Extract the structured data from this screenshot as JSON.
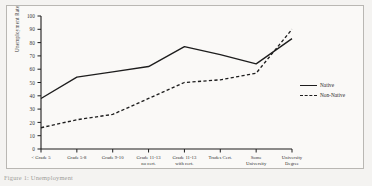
{
  "figure": {
    "caption": "Figure 1: Unemployment"
  },
  "legend": {
    "position": "right",
    "items": [
      {
        "label": "Native",
        "style": "solid"
      },
      {
        "label": "Non-Native",
        "style": "dashed"
      }
    ]
  },
  "axes": {
    "ylabel": "Unemployment Rate",
    "yticks": [
      "100",
      "90",
      "80",
      "70",
      "60",
      "50",
      "40",
      "30",
      "20",
      "10",
      "0"
    ],
    "xticks": [
      "< Grade 5",
      "Grade 5-8",
      "Grade 9-10",
      "Grade 11-13 no cert.",
      "Grade 11-13 with cert.",
      "Trades Cert.",
      "Some University",
      "University Degree"
    ]
  },
  "chart_data": {
    "type": "line",
    "title": "",
    "xlabel": "",
    "ylabel": "Unemployment Rate",
    "ylim": [
      0,
      100
    ],
    "grid": false,
    "legend_position": "right",
    "categories": [
      "< Grade 5",
      "Grade 5-8",
      "Grade 9-10",
      "Grade 11-13 no cert.",
      "Grade 11-13 with cert.",
      "Trades Cert.",
      "Some University",
      "University Degree"
    ],
    "series": [
      {
        "name": "Native",
        "style": "solid",
        "color": "#1d1d1d",
        "values": [
          38,
          54,
          58,
          62,
          77,
          71,
          64,
          83
        ]
      },
      {
        "name": "Non-Native",
        "style": "dashed",
        "color": "#1d1d1d",
        "values": [
          16,
          22,
          26,
          38,
          50,
          52,
          57,
          90
        ]
      }
    ]
  }
}
